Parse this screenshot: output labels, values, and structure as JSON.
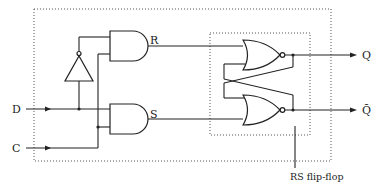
{
  "diagram": {
    "inputs": [
      {
        "id": "D",
        "label": "D"
      },
      {
        "id": "C",
        "label": "C"
      }
    ],
    "outputs": [
      {
        "id": "Q",
        "label": "Q"
      },
      {
        "id": "Qbar",
        "label": "Q̄"
      }
    ],
    "internal_signals": [
      {
        "id": "R",
        "label": "R"
      },
      {
        "id": "S",
        "label": "S"
      }
    ],
    "gates": [
      {
        "id": "not1",
        "type": "NOT",
        "input": "D",
        "output": "D'"
      },
      {
        "id": "and_r",
        "type": "AND",
        "inputs": [
          "D'",
          "C"
        ],
        "output": "R"
      },
      {
        "id": "and_s",
        "type": "AND",
        "inputs": [
          "D",
          "C"
        ],
        "output": "S"
      },
      {
        "id": "nor_q",
        "type": "NOR",
        "inputs": [
          "R",
          "Q̄"
        ],
        "output": "Q"
      },
      {
        "id": "nor_qbar",
        "type": "NOR",
        "inputs": [
          "S",
          "Q"
        ],
        "output": "Q̄"
      }
    ],
    "annotation": "RS flip-flop",
    "colors": {
      "line": "#222222",
      "background": "#ffffff",
      "dotted_box": "#555555"
    }
  }
}
